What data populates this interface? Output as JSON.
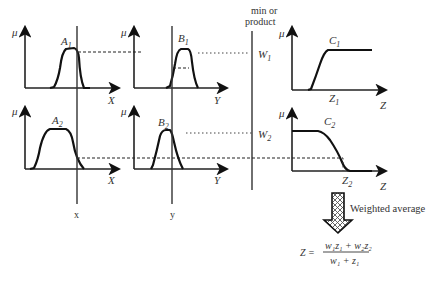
{
  "diagram": {
    "operator_label_line1": "min or",
    "operator_label_line2": "product",
    "axis_mu": "μ",
    "rule1": {
      "input1_set": "A",
      "input1_sub": "1",
      "input1_axis": "X",
      "input2_set": "B",
      "input2_sub": "1",
      "input2_axis": "Y",
      "weight": "W",
      "weight_sub": "1",
      "output_set": "C",
      "output_sub": "1",
      "output_value": "Z",
      "output_value_sub": "1",
      "output_axis": "Z"
    },
    "rule2": {
      "input1_set": "A",
      "input1_sub": "2",
      "input1_axis": "X",
      "input2_set": "B",
      "input2_sub": "2",
      "input2_axis": "Y",
      "weight": "W",
      "weight_sub": "2",
      "output_set": "C",
      "output_sub": "2",
      "output_value": "Z",
      "output_value_sub": "2",
      "output_axis": "Z"
    },
    "crisp_input_x": "x",
    "crisp_input_y": "y",
    "defuzz_label": "Weighted average",
    "formula": {
      "lhs": "Z =",
      "numerator": "w₁z₁ + w₂z₂",
      "denominator": "w₁ + z₁"
    }
  }
}
